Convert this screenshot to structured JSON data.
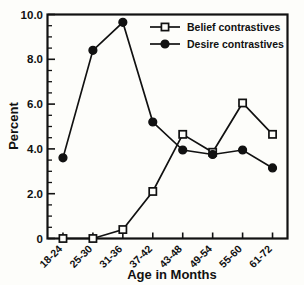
{
  "chart_data": {
    "type": "line",
    "title": "",
    "xlabel": "Age in Months",
    "ylabel": "Percent",
    "categories": [
      "18-24",
      "25-30",
      "31-36",
      "37-42",
      "43-48",
      "49-54",
      "55-60",
      "61-72"
    ],
    "series": [
      {
        "name": "Belief contrastives",
        "marker": "open-square",
        "color": "#111111",
        "values": [
          0.0,
          0.0,
          0.4,
          2.1,
          4.65,
          3.85,
          6.05,
          4.65
        ]
      },
      {
        "name": "Desire contrastives",
        "marker": "filled-circle",
        "color": "#111111",
        "values": [
          3.6,
          8.4,
          9.65,
          5.2,
          3.95,
          3.75,
          3.95,
          3.15
        ]
      }
    ],
    "ylim": [
      0,
      10
    ],
    "yticks": [
      0,
      2.0,
      4.0,
      6.0,
      8.0,
      10.0
    ],
    "ytick_labels": [
      "0",
      "2.0",
      "4.0",
      "6.0",
      "8.0",
      "10.0"
    ],
    "y_minor_step": 0.5,
    "grid": false,
    "legend_position": "top-right",
    "legend": [
      "Belief contrastives",
      "Desire contrastives"
    ]
  },
  "legend": {
    "items": [
      {
        "label": "Belief contrastives",
        "marker": "open-square"
      },
      {
        "label": "Desire contrastives",
        "marker": "filled-circle"
      }
    ]
  },
  "axes": {
    "y_title": "Percent",
    "x_title": "Age in Months"
  }
}
